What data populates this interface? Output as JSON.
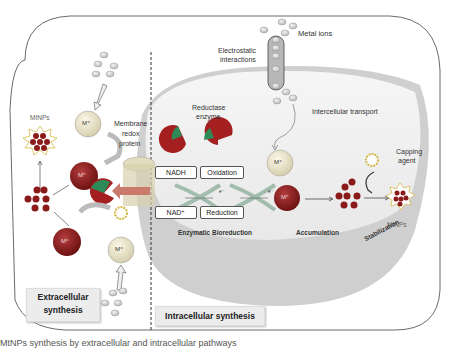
{
  "diagram": {
    "labels": {
      "metal_ions": "Metal ions",
      "electrostatic": "Electrostatic interactions",
      "electrostatic_l1": "Electrostatic",
      "electrostatic_l2": "interactions",
      "intercellular_transport": "Intercellular transport",
      "reductase_l1": "Reductase",
      "reductase_l2": "enzyme",
      "membrane_l1": "Membrane",
      "membrane_l2": "redox",
      "membrane_l3": "protein",
      "mtnps_left": "MtNPs",
      "mtnps_right": "MtNPs",
      "capping_l1": "Capping",
      "capping_l2": "agent",
      "nadh": "NADH",
      "nad_plus": "NAD⁺",
      "oxidation": "Oxidation",
      "reduction": "Reduction",
      "electron1": "e⁻",
      "electron2": "e⁻",
      "enzymatic_bioreduction": "Enzymatic Bioreduction",
      "accumulation": "Accumulation",
      "stabilization": "Stabilization",
      "m_plus": "M⁺",
      "m_zero": "M⁰"
    },
    "panels": {
      "extracellular_l1": "Extracellular",
      "extracellular_l2": "synthesis",
      "intracellular": "Intracellular synthesis"
    },
    "caption": "MtNPs synthesis by extracellular and intracellular pathways",
    "colors": {
      "m_zero": "#8b1a1a",
      "m_plus": "#e6e0c8",
      "nanoparticle": "#8b1a1a",
      "enzyme": "#a41f1f",
      "enzyme_accent": "#2e8b57",
      "cell_fill": "#f3f3f3",
      "cell_rim": "#c9c9c9",
      "ion": "#d5d5d5"
    }
  }
}
